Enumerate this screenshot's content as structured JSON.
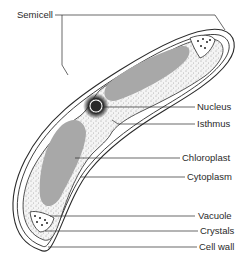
{
  "labels": {
    "semicell": "Semicell",
    "nucleus": "Nucleus",
    "isthmus": "Isthmus",
    "chloroplast": "Chloroplast",
    "cytoplasm": "Cytoplasm",
    "vacuole": "Vacuole",
    "crystals": "Crystals",
    "cell_wall": "Cell wall"
  },
  "colors": {
    "outline": "#2a2a2a",
    "chloroplast": "#a8a8a8",
    "cytoplasm_bg": "#f2f2f2",
    "background": "#ffffff"
  }
}
